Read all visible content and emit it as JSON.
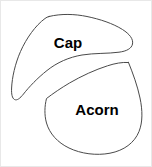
{
  "figure": {
    "background_color": "#ffffff",
    "stroke_color": "#4a4a4a",
    "label_color": "#000000",
    "border_color": "#e8e8e8",
    "width": 152,
    "height": 167
  },
  "shapes": [
    {
      "id": "cap",
      "label": "Cap",
      "label_x": 67,
      "label_y": 43,
      "font_size": 15,
      "description": "crescent-shaped acorn cap outline, upper left"
    },
    {
      "id": "acorn",
      "label": "Acorn",
      "label_x": 96,
      "label_y": 110,
      "font_size": 15,
      "description": "rounded teardrop acorn nut outline, lower right"
    }
  ]
}
